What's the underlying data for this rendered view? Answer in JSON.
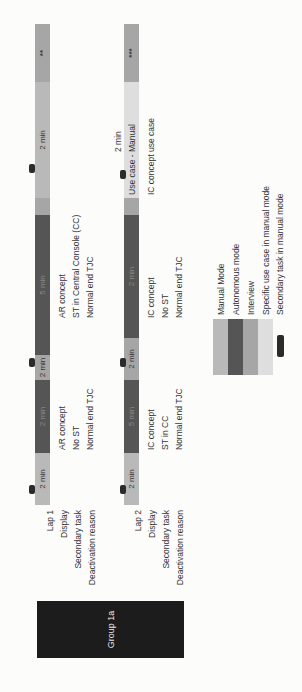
{
  "group": {
    "label": "Group 1a"
  },
  "row_labels": {
    "lap1": [
      "Lap 1",
      "Display",
      "Secondary task",
      "Deactivation reason"
    ],
    "lap2": [
      "Lap 2",
      "Display",
      "Secondary task",
      "Deactivation reason"
    ]
  },
  "colors": {
    "manual": "#b9b9b9",
    "autonomous": "#555555",
    "interview": "#a6a6a6",
    "use_case": "#dedede",
    "secondary_task": "#2b2b2b",
    "group_box": "#1c1c1c"
  },
  "lap1": {
    "segments": [
      {
        "type": "manual",
        "label": "2 min"
      },
      {
        "type": "autonomous",
        "label": "2 min"
      },
      {
        "type": "interview",
        "label": "2 min"
      },
      {
        "type": "autonomous",
        "label": "5 min"
      },
      {
        "type": "interview",
        "label": ""
      },
      {
        "type": "manual",
        "label": "2 min"
      },
      {
        "type": "interview",
        "label": "**"
      }
    ],
    "block1": {
      "display": "AR concept",
      "secondary_task": "No ST",
      "deactivation": "Normal end TJC"
    },
    "block2": {
      "display": "AR concept",
      "secondary_task": "ST in Central Console (CC)",
      "deactivation": "Normal end TJC"
    }
  },
  "lap2": {
    "segments": [
      {
        "type": "manual",
        "label": "2 min"
      },
      {
        "type": "autonomous",
        "label": "5 min"
      },
      {
        "type": "interview",
        "label": "2 min"
      },
      {
        "type": "autonomous",
        "label": "2 min"
      },
      {
        "type": "interview",
        "label": ""
      },
      {
        "type": "use_case",
        "label": ""
      },
      {
        "type": "interview",
        "label": "***"
      }
    ],
    "block1": {
      "display": "IC concept",
      "secondary_task": "ST in CC",
      "deactivation": "Normal end TJC"
    },
    "block2": {
      "display": "IC concept",
      "secondary_task": "No ST",
      "deactivation": "Normal end TJC"
    },
    "use_case": {
      "duration": "2 min",
      "title": "Use case - Manual",
      "subtitle": "IC concept use case"
    }
  },
  "legend": [
    {
      "key": "manual",
      "label": "Manual Mode"
    },
    {
      "key": "autonomous",
      "label": "Autonomous mode"
    },
    {
      "key": "interview",
      "label": "Interview"
    },
    {
      "key": "use_case",
      "label": "Specific use case in manual mode"
    },
    {
      "key": "secondary_task",
      "label": "Secondary task in manual mode"
    }
  ]
}
